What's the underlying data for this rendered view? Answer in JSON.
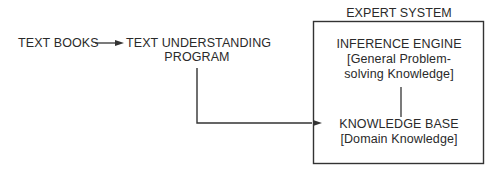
{
  "diagram": {
    "nodes": {
      "text_books": "TEXT BOOKS",
      "tup_line1": "TEXT UNDERSTANDING",
      "tup_line2": "PROGRAM",
      "expert_system_title": "EXPERT SYSTEM",
      "inference_engine": "INFERENCE ENGINE",
      "inference_desc_line1": "[General Problem-",
      "inference_desc_line2": "solving Knowledge]",
      "knowledge_base": "KNOWLEDGE BASE",
      "knowledge_base_desc": "[Domain Knowledge]"
    },
    "edges": [
      {
        "from": "TEXT BOOKS",
        "to": "TEXT UNDERSTANDING PROGRAM",
        "type": "arrow"
      },
      {
        "from": "TEXT UNDERSTANDING PROGRAM",
        "to": "KNOWLEDGE BASE",
        "type": "arrow"
      },
      {
        "from": "INFERENCE ENGINE",
        "to": "KNOWLEDGE BASE",
        "type": "line"
      }
    ],
    "colors": {
      "stroke": "#333333",
      "text": "#2a2a2a",
      "background": "#ffffff"
    }
  }
}
